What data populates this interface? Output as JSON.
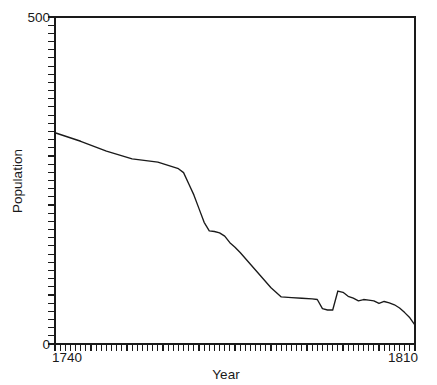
{
  "chart_data": {
    "type": "line",
    "title": "",
    "title_note": "title cropped off at top edge of screenshot - illegible",
    "xlabel": "Year",
    "ylabel": "Population",
    "xlim": [
      1740,
      1810
    ],
    "ylim": [
      0,
      500
    ],
    "xticklabels": [
      "1740",
      "1810"
    ],
    "yticklabels": [
      "0",
      "500"
    ],
    "grid": false,
    "legend": false,
    "minor_tick_interval_x": 1,
    "minor_tick_interval_y": 12.5,
    "line_color": "#1a1a1a",
    "background_color": "#ffffff",
    "series": [
      {
        "name": "Population",
        "x": [
          1740,
          1745,
          1750,
          1755,
          1760,
          1762,
          1764,
          1765,
          1766,
          1767,
          1768,
          1769,
          1770,
          1771,
          1772,
          1773,
          1774,
          1775,
          1776,
          1778,
          1780,
          1782,
          1784,
          1786,
          1788,
          1790,
          1791,
          1792,
          1793,
          1794,
          1795,
          1796,
          1797,
          1798,
          1799,
          1800,
          1801,
          1802,
          1803,
          1804,
          1805,
          1806,
          1807,
          1808,
          1809,
          1810
        ],
        "values": [
          323,
          310,
          295,
          283,
          278,
          273,
          268,
          262,
          245,
          228,
          207,
          186,
          173,
          172,
          170,
          165,
          155,
          148,
          140,
          122,
          104,
          86,
          72,
          71,
          70,
          69,
          68,
          54,
          52,
          52,
          81,
          79,
          73,
          70,
          66,
          68,
          67,
          66,
          62,
          65,
          63,
          60,
          55,
          48,
          40,
          29
        ]
      }
    ]
  },
  "axes": {
    "y_top_label": "500",
    "y_bottom_label": "0",
    "x_left_label": "1740",
    "x_right_label": "1810",
    "x_axis_title": "Year",
    "y_axis_title": "Population"
  }
}
